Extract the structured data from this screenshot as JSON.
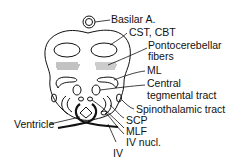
{
  "diagram": {
    "labels": {
      "basilar": "Basilar A.",
      "cst": "CST, CBT",
      "ponto1": "Pontocerebellar",
      "ponto2": "fibers",
      "ml": "ML",
      "ctt1": "Central",
      "ctt2": "tegmental tract",
      "stt": "Spinothalamic tract",
      "scp": "SCP",
      "mlf": "MLF",
      "ivn": "IV nucl.",
      "iv": "IV",
      "ventricle": "Ventricle"
    }
  }
}
